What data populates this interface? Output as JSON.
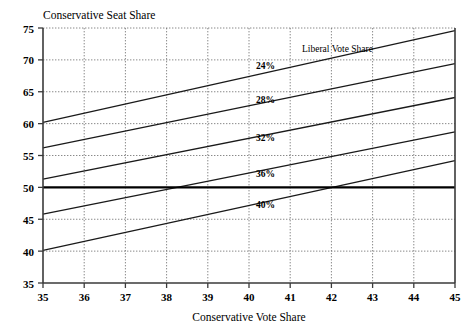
{
  "chart_data": {
    "type": "line",
    "title": "",
    "ylabel": "Conservative Seat Share",
    "xlabel": "Conservative Vote Share",
    "legend_title": "Liberal Vote Share",
    "legend_position": "inside-upper-right",
    "grid": true,
    "xlim": [
      35,
      45
    ],
    "ylim": [
      35,
      75
    ],
    "xticks": [
      35,
      36,
      37,
      38,
      39,
      40,
      41,
      42,
      43,
      44,
      45
    ],
    "yticks": [
      35,
      40,
      45,
      50,
      55,
      60,
      65,
      70,
      75
    ],
    "xtick_labels": [
      "35",
      "36",
      "37",
      "38",
      "39",
      "40",
      "41",
      "42",
      "43",
      "44",
      "45"
    ],
    "ytick_labels": [
      "35",
      "40",
      "45",
      "50",
      "55",
      "60",
      "65",
      "70",
      "75"
    ],
    "x": [
      35,
      45
    ],
    "series": [
      {
        "name": "24%",
        "label": "24%",
        "values": [
          60.2,
          74.6
        ],
        "label_x": 40.4,
        "label_y": 68.5
      },
      {
        "name": "28%",
        "label": "28%",
        "values": [
          56.2,
          69.4
        ],
        "label_x": 40.4,
        "label_y": 63.2
      },
      {
        "name": "32%",
        "label": "32%",
        "values": [
          51.3,
          64.1
        ],
        "label_x": 40.4,
        "label_y": 57.2
      },
      {
        "name": "36%",
        "label": "36%",
        "values": [
          45.8,
          58.7
        ],
        "label_x": 40.4,
        "label_y": 51.6
      },
      {
        "name": "40%",
        "label": "40%",
        "values": [
          40.1,
          54.2
        ],
        "label_x": 40.4,
        "label_y": 46.8
      }
    ],
    "reference_lines": [
      {
        "name": "majority-threshold",
        "orientation": "horizontal",
        "value": 50
      }
    ]
  }
}
